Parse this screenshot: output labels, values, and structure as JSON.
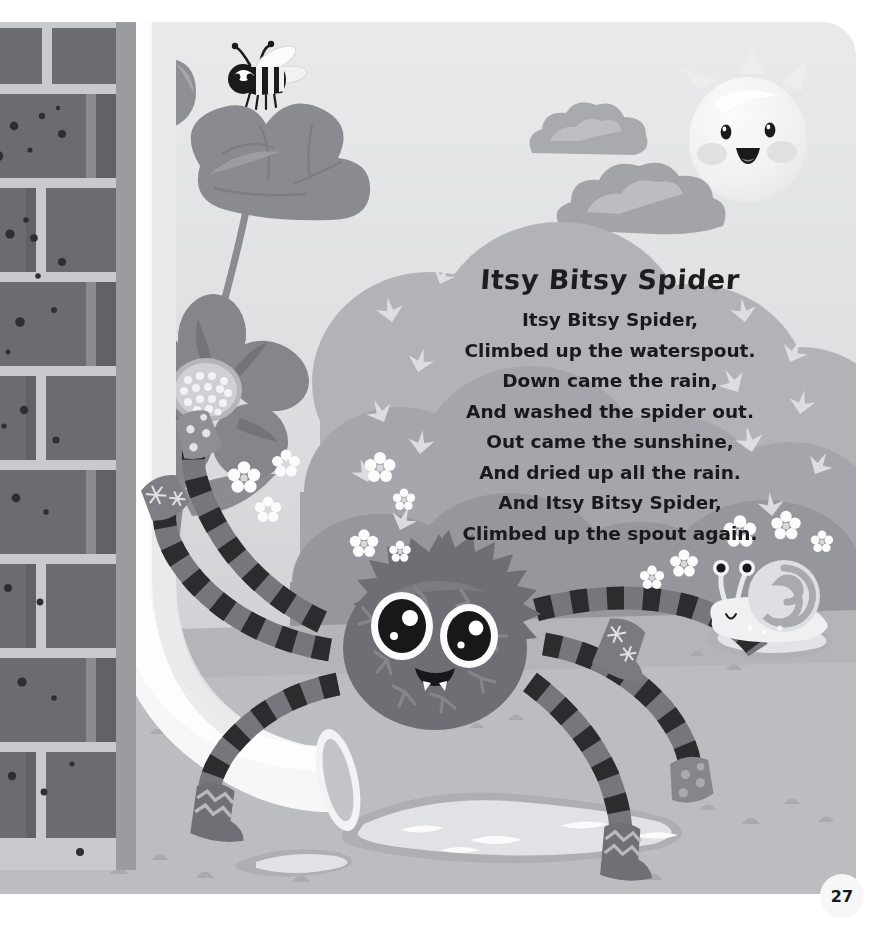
{
  "page": {
    "number": "27",
    "kind": "picture-book-page"
  },
  "poem": {
    "title": "Itsy Bitsy Spider",
    "lines": [
      "Itsy Bitsy Spider,",
      "Climbed up the waterspout.",
      "Down came the rain,",
      "And washed the spider out.",
      "Out came the sunshine,",
      "And dried up all the rain.",
      "And Itsy Bitsy Spider,",
      "Climbed up the spout again."
    ]
  },
  "illustration": {
    "scene": "spider-and-waterspout",
    "elements": [
      "brick-wall",
      "drainpipe-waterspout",
      "poppy-flowers",
      "bee",
      "clouds",
      "sun",
      "bushes",
      "spider",
      "snail",
      "puddles",
      "ground-pebbles",
      "small-white-flowers"
    ]
  },
  "colors": {
    "sky_top": "#e9e9ea",
    "sky_bottom": "#c9cacd",
    "ground": "#bfc0c3",
    "bush": "#a8a9ad",
    "bush_dark": "#9a9b9f",
    "cloud": "#adaeb2",
    "cloud_light": "#c4c5c9",
    "sun": "#f3f3f3",
    "brick": "#6b6c70",
    "brick_mortar": "#c9cacd",
    "pipe": "#fafafa",
    "spider_body": "#6e6f73",
    "spider_body_light": "#85868a",
    "leg_dark": "#2c2c2e",
    "leg_light": "#74757a",
    "text": "#1a1a1c",
    "puddle": "#d8d9dc",
    "flower_petal": "#8e8f94",
    "page_badge": "#f7f7f8"
  }
}
